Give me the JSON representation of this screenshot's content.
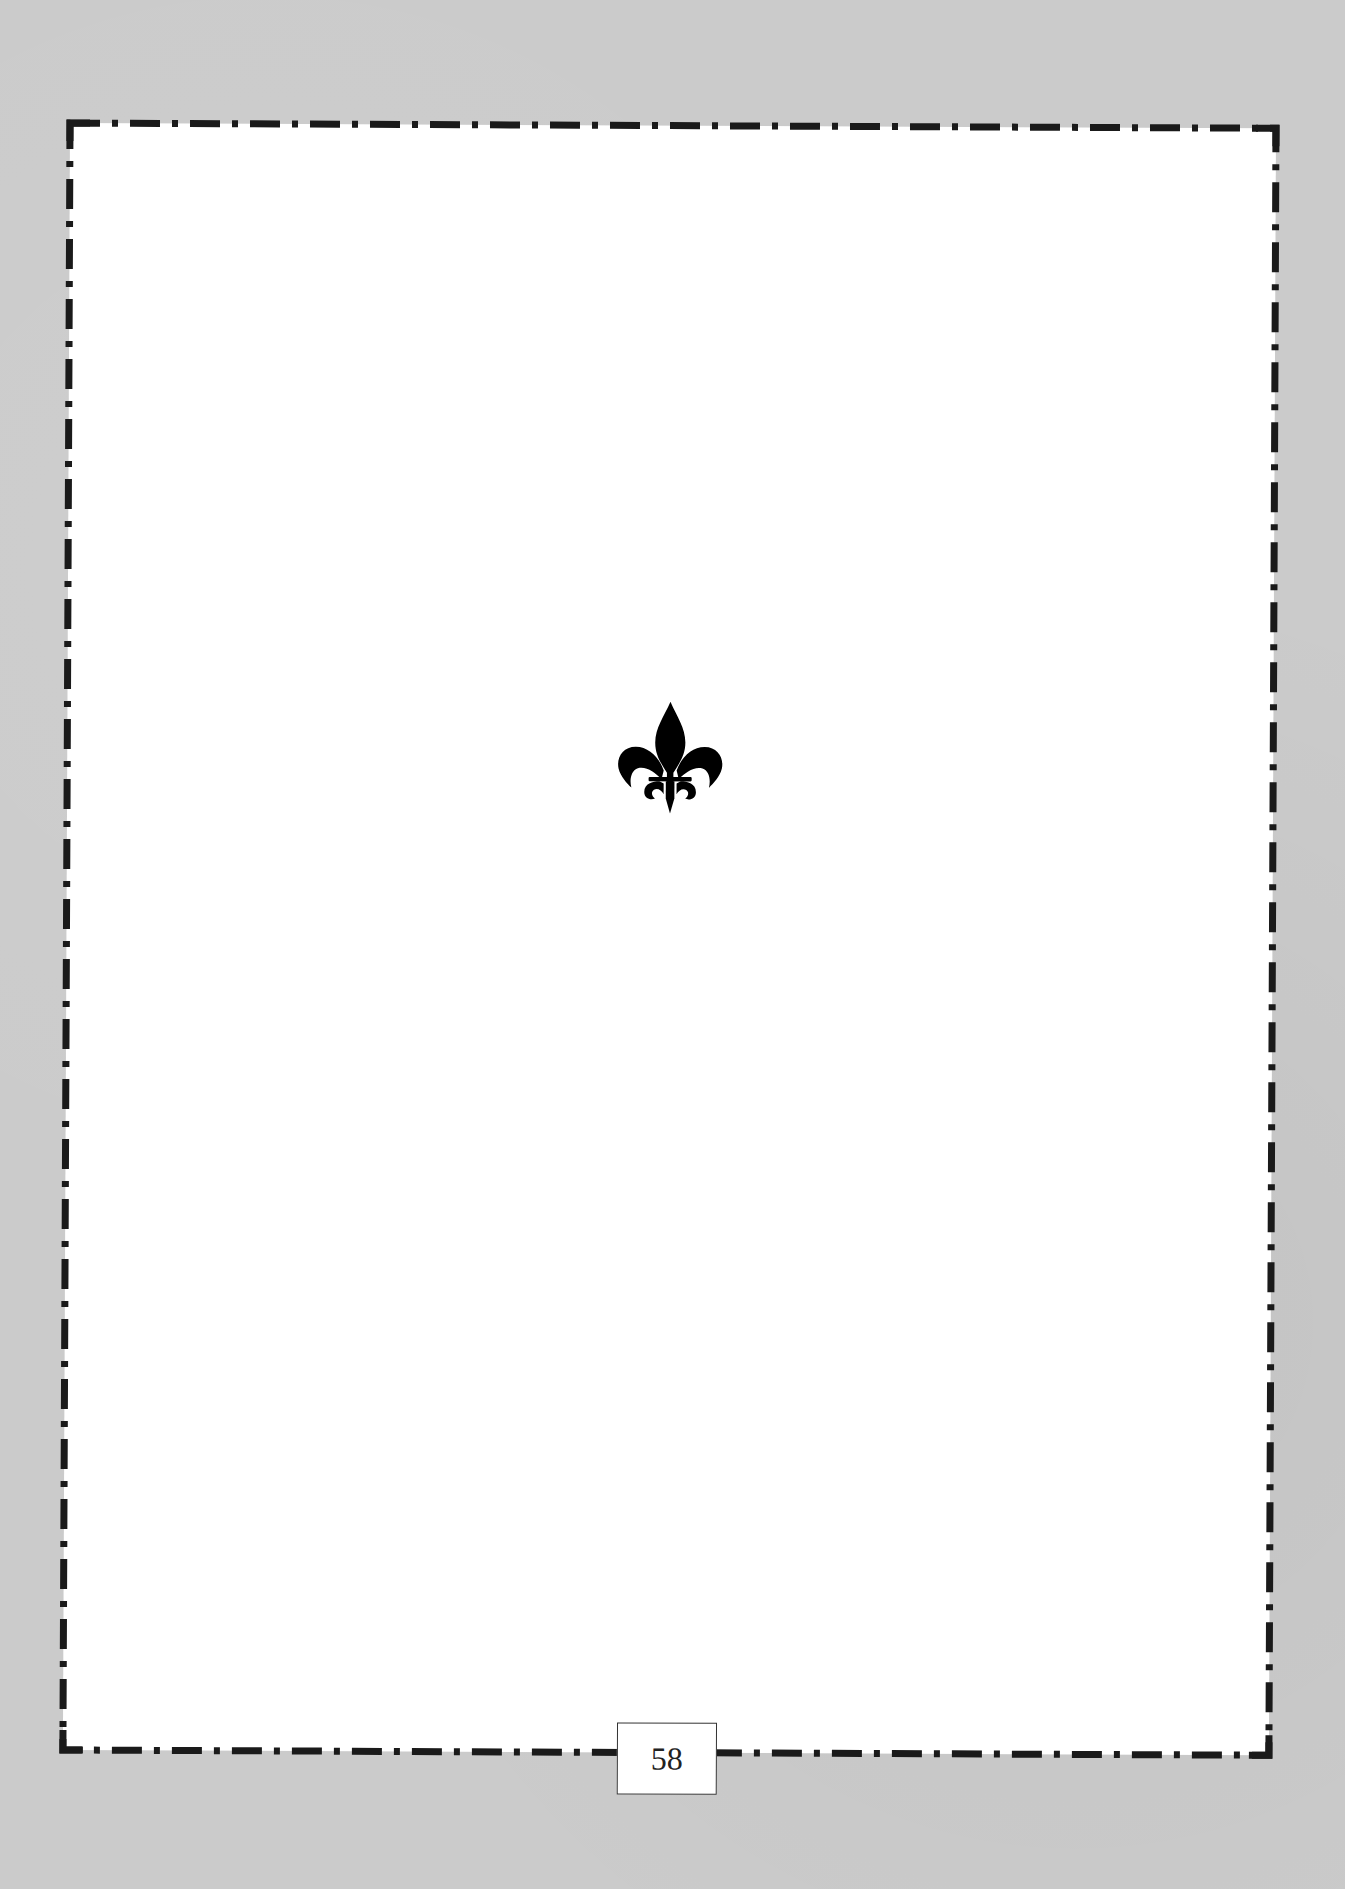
{
  "document": {
    "type": "book-page",
    "ornament": {
      "icon": "fleur-de-lis-icon",
      "color": "#000000"
    },
    "page_number": "58",
    "border": {
      "style": "dash-dot",
      "color": "#1a1a1a"
    },
    "colors": {
      "page": "#ffffff",
      "background": "#cbcbcb"
    }
  }
}
